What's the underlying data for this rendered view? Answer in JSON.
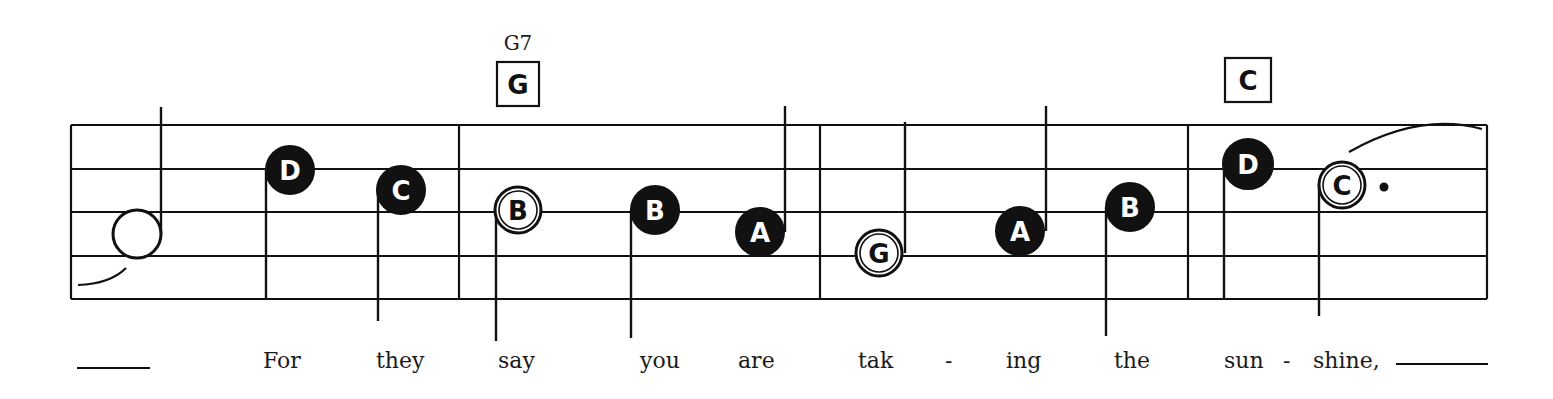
{
  "score": {
    "ink_color": "#111111",
    "paper_color": "#ffffff",
    "staff": {
      "left": 71,
      "right": 1487,
      "lines_y": [
        125,
        169,
        212,
        256,
        299
      ]
    },
    "barlines_x": [
      71,
      459,
      820,
      1188,
      1487
    ],
    "chords": [
      {
        "name": "G7",
        "box_label": "G",
        "name_x": 518,
        "name_y": 50,
        "box_x": 497,
        "box_y": 62,
        "box_w": 42,
        "box_h": 44
      },
      {
        "name": "",
        "box_label": "C",
        "box_x": 1225,
        "box_y": 58,
        "box_w": 46,
        "box_h": 44
      }
    ],
    "notes": [
      {
        "label": "",
        "filled": false,
        "cx": 137,
        "cy": 234,
        "r": 24,
        "stem": "up",
        "stem_x": 161,
        "stem_end": 107
      },
      {
        "label": "D",
        "filled": true,
        "cx": 290,
        "cy": 170,
        "r": 24,
        "stem": "down",
        "stem_x": 266,
        "stem_end": 299
      },
      {
        "label": "C",
        "filled": true,
        "cx": 401,
        "cy": 190,
        "r": 24,
        "stem": "down",
        "stem_x": 378,
        "stem_end": 321
      },
      {
        "label": "B",
        "filled": false,
        "cx": 518,
        "cy": 210,
        "r": 23,
        "stem": "down",
        "stem_x": 496,
        "stem_end": 341
      },
      {
        "label": "B",
        "filled": true,
        "cx": 655,
        "cy": 210,
        "r": 24,
        "stem": "down",
        "stem_x": 631,
        "stem_end": 338
      },
      {
        "label": "A",
        "filled": true,
        "cx": 760,
        "cy": 232,
        "r": 24,
        "stem": "up",
        "stem_x": 785,
        "stem_end": 106
      },
      {
        "label": "G",
        "filled": false,
        "cx": 879,
        "cy": 253,
        "r": 23,
        "stem": "up",
        "stem_x": 905,
        "stem_end": 122
      },
      {
        "label": "A",
        "filled": true,
        "cx": 1020,
        "cy": 231,
        "r": 24,
        "stem": "up",
        "stem_x": 1046,
        "stem_end": 106
      },
      {
        "label": "B",
        "filled": true,
        "cx": 1130,
        "cy": 207,
        "r": 24,
        "stem": "down",
        "stem_x": 1106,
        "stem_end": 336
      },
      {
        "label": "D",
        "filled": true,
        "cx": 1248,
        "cy": 164,
        "r": 25,
        "stem": "down",
        "stem_x": 1224,
        "stem_end": 299
      },
      {
        "label": "C",
        "filled": false,
        "cx": 1342,
        "cy": 185,
        "r": 23,
        "stem": "down",
        "stem_x": 1319,
        "stem_end": 316,
        "dotted": true,
        "dot_x": 1384,
        "dot_y": 187
      }
    ],
    "ties": [
      {
        "d": "M 78 285 Q 110 284 126 268"
      },
      {
        "d": "M 1349 152 Q 1420 112 1482 129"
      }
    ],
    "lyrics": [
      {
        "text": "For",
        "x": 263
      },
      {
        "text": "they",
        "x": 376
      },
      {
        "text": "say",
        "x": 498
      },
      {
        "text": "you",
        "x": 640
      },
      {
        "text": "are",
        "x": 738
      },
      {
        "text": "tak",
        "x": 858
      },
      {
        "text": "-",
        "x": 945
      },
      {
        "text": "ing",
        "x": 1006
      },
      {
        "text": "the",
        "x": 1114
      },
      {
        "text": "sun",
        "x": 1224
      },
      {
        "text": "-",
        "x": 1283
      },
      {
        "text": "shine,",
        "x": 1313
      }
    ],
    "lyrics_baseline": 368,
    "extenders": [
      {
        "x1": 77,
        "x2": 150,
        "y": 368
      },
      {
        "x1": 1396,
        "x2": 1488,
        "y": 364
      }
    ]
  }
}
